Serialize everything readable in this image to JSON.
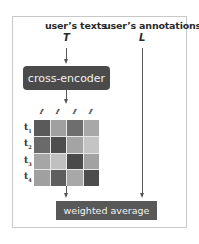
{
  "diagram": {
    "texts_label": "user’s texts",
    "texts_symbol": "T",
    "annotations_label": "user’s annotations",
    "annotations_symbol": "L",
    "encoder_label": "cross-encoder",
    "output_label": "weighted average",
    "annotation_icons": [
      "ℓ",
      "ℓ",
      "ℓ",
      "ℓ"
    ],
    "row_labels": [
      {
        "base": "t",
        "sub": "1"
      },
      {
        "base": "t",
        "sub": "2"
      },
      {
        "base": "t",
        "sub": "3"
      },
      {
        "base": "t",
        "sub": "4"
      }
    ],
    "matrix_colors": [
      [
        "#5a5a5a",
        "#a0a0a0",
        "#6e6e6e",
        "#a8a8a8"
      ],
      [
        "#6a6a6a",
        "#4e4e4e",
        "#a4a4a4",
        "#c4c4c4"
      ],
      [
        "#a6a6a6",
        "#c0c0c0",
        "#4a4a4a",
        "#a2a2a2"
      ],
      [
        "#a0a0a0",
        "#5e5e5e",
        "#a8a8a8",
        "#4c4c4c"
      ]
    ],
    "colors": {
      "encoder_fill": "#4b4b4b",
      "output_fill": "#585858",
      "frame_border": "#c8c8c8"
    }
  }
}
